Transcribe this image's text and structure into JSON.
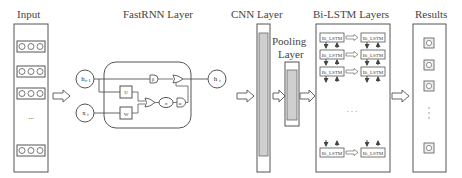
{
  "sections": {
    "input": {
      "title": "Input",
      "rows": [
        "ooo",
        "ooo",
        "ooo",
        "ooo"
      ],
      "ellipsis": "..."
    },
    "fastrnn": {
      "title": "FastRNN Layer",
      "nodes": {
        "h_prev": "h",
        "h_prev_sub": "t-1",
        "x_t": "x",
        "x_t_sub": "t",
        "h_t": "h",
        "h_t_sub": "t"
      },
      "weights": {
        "U": "U",
        "W": "W"
      },
      "gates": {
        "beta": "β",
        "sigma": "σ",
        "alpha": "α"
      }
    },
    "cnn": {
      "title": "CNN Layer"
    },
    "pooling": {
      "title_line1": "Pooling",
      "title_line2": "Layer"
    },
    "bilstm": {
      "title": "Bi-LSTM Layers",
      "cell_label": "Bi_LSTM",
      "rows": 4,
      "ellipsis": "· · ·"
    },
    "results": {
      "title": "Results",
      "outputs": 4,
      "ellipsis": "⋮"
    }
  }
}
